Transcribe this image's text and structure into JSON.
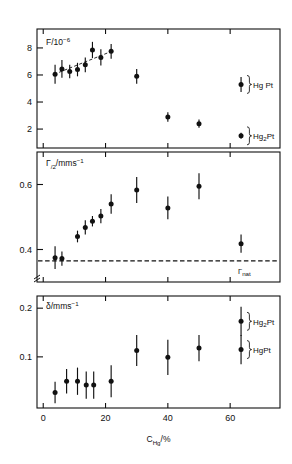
{
  "figure": {
    "xlabel": "C",
    "xlabel_sub": "Hg",
    "xlabel_unit": "/%",
    "x_ticks": [
      "0",
      "20",
      "40",
      "60"
    ],
    "x_tick_values": [
      0,
      20,
      40,
      60
    ],
    "xlim": [
      -2,
      76
    ]
  },
  "panels": {
    "top": {
      "ylabel_main": "F/10",
      "ylabel_exp": "−6",
      "y_ticks": [
        "2",
        "4",
        "6",
        "8"
      ],
      "y_tick_values": [
        2,
        4,
        6,
        8
      ],
      "ylim": [
        0.6,
        9.4
      ],
      "legend": [
        {
          "label_main": "Hg Pt",
          "label_sub": "",
          "label_tail": "",
          "y": 5.3
        },
        {
          "label_main": "Hg",
          "label_sub": "2",
          "label_tail": "Pt",
          "y": 1.5
        }
      ]
    },
    "middle": {
      "ylabel_main": "Γ",
      "ylabel_sub": "/2",
      "ylabel_unit": "/mms",
      "ylabel_exp": "−1",
      "y_ticks": [
        "0.4",
        "0.6"
      ],
      "y_tick_values": [
        0.4,
        0.6
      ],
      "ylim": [
        0.3,
        0.7
      ],
      "nat_label_main": "Γ",
      "nat_label_sub": "nat",
      "nat_value": 0.365
    },
    "bottom": {
      "ylabel_main": "δ/mms",
      "ylabel_exp": "−1",
      "y_ticks": [
        "0.1",
        "0.2"
      ],
      "y_tick_values": [
        0.1,
        0.2
      ],
      "ylim": [
        -0.005,
        0.225
      ],
      "legend": [
        {
          "label_main": "Hg",
          "label_sub": "2",
          "label_tail": "Pt",
          "y": 0.173
        },
        {
          "label_main": "HgPt",
          "label_sub": "",
          "label_tail": "",
          "y": 0.115
        }
      ]
    }
  },
  "chart_data": {
    "type": "scatter",
    "title": "",
    "xlabel": "C_Hg/%",
    "panel_count": 3,
    "grid": false,
    "legend_position": "right-inside",
    "panels": [
      {
        "name": "top",
        "ylabel": "F/10^-6",
        "ylim": [
          0.6,
          9.4
        ],
        "yticks": [
          2,
          4,
          6,
          8
        ],
        "series": [
          {
            "name": "F",
            "x": [
              3.8,
              6.0,
              8.5,
              11.0,
              13.5,
              15.8,
              18.5,
              21.8,
              30.0,
              40.0,
              50.0
            ],
            "y": [
              6.05,
              6.45,
              6.25,
              6.4,
              6.75,
              7.85,
              7.3,
              7.75,
              5.9,
              2.9,
              2.4
            ],
            "yerr": [
              0.7,
              0.65,
              0.5,
              0.5,
              0.55,
              0.6,
              0.6,
              0.55,
              0.55,
              0.35,
              0.3
            ]
          },
          {
            "name": "F_legend_HgPt",
            "x": [
              63.5
            ],
            "y": [
              5.3
            ],
            "yerr": [
              0.55
            ]
          },
          {
            "name": "F_legend_Hg2Pt",
            "x": [
              63.5
            ],
            "y": [
              1.5
            ],
            "yerr": [
              0.22
            ]
          }
        ],
        "trendline": {
          "x": [
            3.5,
            22.5
          ],
          "y": [
            6.05,
            7.8
          ],
          "style": "dashed"
        }
      },
      {
        "name": "middle",
        "ylabel": "Γ/2 / mms^-1",
        "ylim": [
          0.3,
          0.7
        ],
        "yticks": [
          0.4,
          0.6
        ],
        "series": [
          {
            "name": "Gamma_half",
            "x": [
              3.8,
              6.0,
              11.0,
              13.5,
              15.8,
              18.5,
              21.8,
              30.0,
              40.0,
              50.0,
              63.5
            ],
            "y": [
              0.375,
              0.372,
              0.44,
              0.468,
              0.487,
              0.503,
              0.54,
              0.583,
              0.528,
              0.595,
              0.418
            ],
            "yerr": [
              0.035,
              0.022,
              0.018,
              0.022,
              0.016,
              0.022,
              0.03,
              0.04,
              0.035,
              0.04,
              0.028
            ]
          }
        ],
        "reference_line": {
          "label": "Γ_nat",
          "value": 0.365,
          "style": "dashed"
        }
      },
      {
        "name": "bottom",
        "ylabel": "δ / mms^-1",
        "ylim": [
          -0.005,
          0.225
        ],
        "yticks": [
          0.1,
          0.2
        ],
        "series": [
          {
            "name": "delta",
            "x": [
              3.8,
              7.5,
              11.0,
              13.8,
              16.2,
              21.8,
              30.0,
              40.0,
              50.0
            ],
            "y": [
              0.027,
              0.05,
              0.05,
              0.042,
              0.042,
              0.05,
              0.113,
              0.099,
              0.118
            ],
            "yerr": [
              0.022,
              0.025,
              0.028,
              0.028,
              0.028,
              0.033,
              0.032,
              0.036,
              0.027
            ]
          },
          {
            "name": "delta_legend_Hg2Pt",
            "x": [
              63.5
            ],
            "y": [
              0.173
            ],
            "yerr": [
              0.03
            ]
          },
          {
            "name": "delta_legend_HgPt",
            "x": [
              63.5
            ],
            "y": [
              0.115
            ],
            "yerr": [
              0.03
            ]
          }
        ]
      }
    ]
  }
}
